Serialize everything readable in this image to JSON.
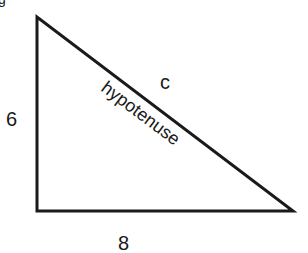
{
  "diagram": {
    "type": "right-triangle",
    "top_partial_glyph": "g",
    "labels": {
      "vertical_side": "6",
      "horizontal_side": "8",
      "hypotenuse_letter": "c",
      "hypotenuse_word": "hypotenuse"
    },
    "vertices": {
      "top": [
        37,
        17
      ],
      "right_angle": [
        37,
        211
      ],
      "right": [
        293,
        211
      ]
    },
    "stroke_color": "#1a1a1a"
  }
}
